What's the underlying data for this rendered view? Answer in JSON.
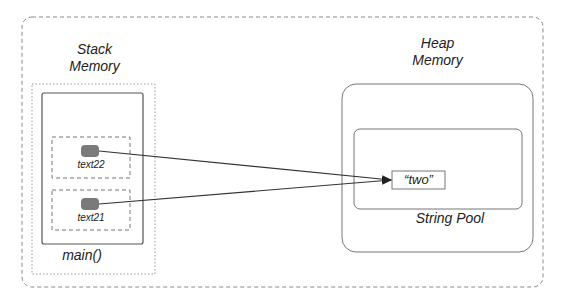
{
  "diagram": {
    "stack": {
      "title_line1": "Stack",
      "title_line2": "Memory",
      "frame_label": "main()",
      "variables": [
        {
          "name": "text22"
        },
        {
          "name": "text21"
        }
      ]
    },
    "heap": {
      "title_line1": "Heap",
      "title_line2": "Memory",
      "pool_label": "String Pool",
      "string_value": "“two”"
    },
    "colors": {
      "line": "#333333",
      "dashed_border": "#8a8a8a",
      "box_border": "#666666",
      "pointer_dot": "#7a7a7a"
    }
  }
}
